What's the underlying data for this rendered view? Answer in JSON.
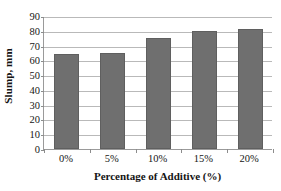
{
  "chart_data": {
    "type": "bar",
    "title": "",
    "xlabel": "Percentage of Additive (%)",
    "ylabel": "Slump, mm",
    "categories": [
      "0%",
      "5%",
      "10%",
      "15%",
      "20%"
    ],
    "values": [
      64.5,
      64.8,
      74.8,
      79.6,
      81.5
    ],
    "series": [
      {
        "name": "Slump",
        "values": [
          64.5,
          64.8,
          74.8,
          79.6,
          81.5
        ]
      }
    ],
    "ylim": [
      0,
      90
    ],
    "xlim_categorical": true,
    "ytick_values": [
      0,
      10,
      20,
      30,
      40,
      50,
      60,
      70,
      80,
      90
    ],
    "ytick_labels": [
      "0",
      "10",
      "20",
      "30",
      "40",
      "50",
      "60",
      "70",
      "80",
      "90"
    ],
    "grid": "horizontal",
    "legend": "none",
    "legend_position": "none",
    "bar_color": "#6f6f6f",
    "bar_border_color": "#5f5f5f",
    "gridline_color": "#b9b9b9",
    "axis_color": "#9a9a9a",
    "background_color": "#ffffff",
    "annotations": []
  }
}
